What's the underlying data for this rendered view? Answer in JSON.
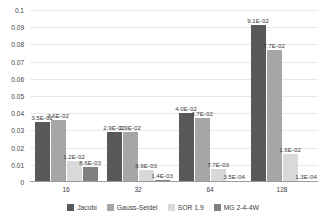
{
  "chart_data": {
    "type": "bar",
    "title": "",
    "xlabel": "",
    "ylabel": "",
    "ylim": [
      0,
      0.1
    ],
    "grid": true,
    "legend_position": "bottom",
    "categories": [
      "16",
      "32",
      "64",
      "128"
    ],
    "y_ticks": [
      "0",
      "0.01",
      "0.02",
      "0.03",
      "0.04",
      "0.05",
      "0.06",
      "0.07",
      "0.08",
      "0.09",
      "0.1"
    ],
    "y_tick_values": [
      0,
      0.01,
      0.02,
      0.03,
      0.04,
      0.05,
      0.06,
      0.07,
      0.08,
      0.09,
      0.1
    ],
    "series": [
      {
        "name": "Jacobi",
        "color": "#595959",
        "values": [
          0.035,
          0.029,
          0.04,
          0.091
        ],
        "labels": [
          "3.5E-02",
          "2.9E-02",
          "4.0E-02",
          "9.1E-02"
        ]
      },
      {
        "name": "Gauss-Seidel",
        "color": "#a6a6a6",
        "values": [
          0.036,
          0.029,
          0.037,
          0.077
        ],
        "labels": [
          "3.6E-02",
          "2.9E-02",
          "3.7E-02",
          "7.7E-02"
        ]
      },
      {
        "name": "SOR 1.9",
        "color": "#d9d9d9",
        "values": [
          0.012,
          0.0069,
          0.0077,
          0.016
        ],
        "labels": [
          "1.2E-02",
          "6.9E-03",
          "7.7E-03",
          "1.6E-02"
        ]
      },
      {
        "name": "MG 2-4-4W",
        "color": "#808080",
        "values": [
          0.0086,
          0.0014,
          0.00035,
          0.00013
        ],
        "labels": [
          "8.6E-03",
          "1.4E-03",
          "3.5E-04",
          "1.3E-04"
        ]
      }
    ]
  },
  "legend": {
    "items": [
      {
        "label": "Jacobi",
        "color": "#595959"
      },
      {
        "label": "Gauss-Seidel",
        "color": "#a6a6a6"
      },
      {
        "label": "SOR 1.9",
        "color": "#d9d9d9"
      },
      {
        "label": "MG 2-4-4W",
        "color": "#808080"
      }
    ]
  },
  "colors": {
    "gridline": "#e8e8e8",
    "axis": "#9a9a9a",
    "text": "#404040",
    "background": "#ffffff"
  }
}
